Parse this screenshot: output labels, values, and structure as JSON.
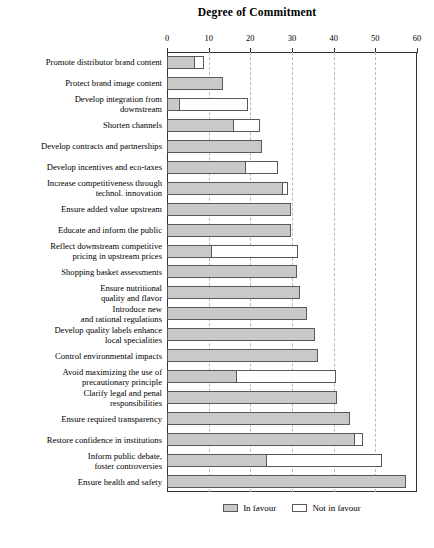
{
  "chart_data": {
    "type": "bar",
    "orientation": "horizontal",
    "stacked": true,
    "title": "Degree of Commitment",
    "xlabel": "",
    "ylabel": "",
    "xlim": [
      0,
      60
    ],
    "xticks": [
      0,
      10,
      20,
      30,
      40,
      50,
      60
    ],
    "grid": "vertical-dashed",
    "legend_position": "bottom-center",
    "categories": [
      "Promote distributor brand content",
      "Protect brand image content",
      "Develop integration from\ndownstream",
      "Shorten channels",
      "Develop contracts and partnerships",
      "Develop incentives and eco-taxes",
      "Increase competitiveness through\ntechnol. innovation",
      "Ensure added value upstream",
      "Educate and inform the public",
      "Reflect downstream competitive\npricing in upstream prices",
      "Shopping basket assessments",
      "Ensure nutritional\nquality and flavor",
      "Introduce new\nand rational regulations",
      "Develop quality labels enhance\nlocal specialities",
      "Control environmental impacts",
      "Avoid maximizing the use of\nprecautionary principle",
      "Clarify legal and penal\nresponsibilities",
      "Ensure required transparency",
      "Restore confidence in institutions",
      "Inform public debate,\nfoster controversies",
      "Ensure health and safety"
    ],
    "series": [
      {
        "name": "In favour",
        "color": "#c9c9c9",
        "values": [
          6.7,
          13.4,
          3.0,
          16.0,
          22.8,
          19.0,
          27.8,
          29.8,
          29.7,
          10.7,
          31.2,
          32.0,
          33.5,
          35.4,
          36.2,
          16.8,
          40.8,
          44.0,
          45.0,
          24.0,
          57.3
        ]
      },
      {
        "name": "Not in favour",
        "color": "#ffffff",
        "values": [
          2.3,
          0.0,
          16.5,
          6.4,
          0.0,
          7.6,
          1.2,
          0.0,
          0.0,
          20.7,
          0.0,
          0.0,
          0.0,
          0.0,
          0.0,
          23.7,
          0.0,
          0.0,
          2.0,
          27.5,
          0.0
        ]
      }
    ]
  },
  "legend": {
    "items": [
      {
        "label": "In favour"
      },
      {
        "label": "Not in favour"
      }
    ]
  }
}
